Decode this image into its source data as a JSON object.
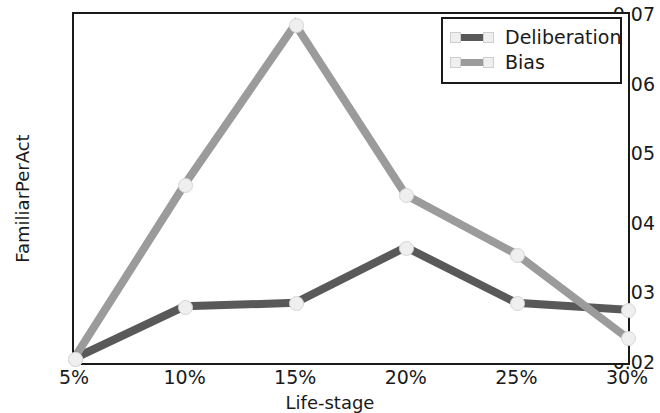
{
  "chart_data": {
    "type": "line",
    "title": "",
    "xlabel": "Life-stage",
    "ylabel": "FamiliarPerAct",
    "categories": [
      "5%",
      "10%",
      "15%",
      "20%",
      "25%",
      "30%"
    ],
    "x_tick_labels": [
      "5%",
      "10%",
      "15%",
      "20%",
      "25%",
      "30%"
    ],
    "y_tick_labels": [
      "0.02",
      "0.03",
      "0.04",
      "0.05",
      "0.06",
      "0.07"
    ],
    "y_tick_values": [
      0.02,
      0.03,
      0.04,
      0.05,
      0.06,
      0.07
    ],
    "ylim": [
      0.02,
      0.07
    ],
    "xlim": [
      0,
      5
    ],
    "grid": false,
    "legend_position": "upper right",
    "series": [
      {
        "name": "Deliberation",
        "color": "#595959",
        "marker": "circle",
        "values": [
          0.0205,
          0.028,
          0.0285,
          0.0365,
          0.0285,
          0.0275
        ]
      },
      {
        "name": "Bias",
        "color": "#9b9b9b",
        "marker": "circle",
        "values": [
          0.0205,
          0.0455,
          0.0685,
          0.044,
          0.0355,
          0.0235
        ]
      }
    ]
  },
  "legend": {
    "items": [
      {
        "label": "Deliberation"
      },
      {
        "label": "Bias"
      }
    ]
  }
}
